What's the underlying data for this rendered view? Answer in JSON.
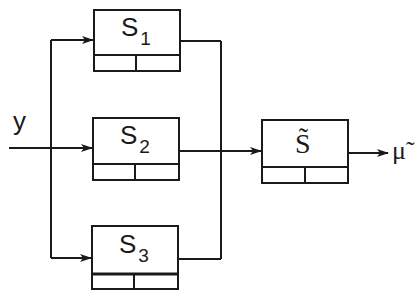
{
  "diagram": {
    "type": "block-diagram",
    "input_label": "y",
    "output_label": "μ̃",
    "blocks": [
      {
        "id": "S1",
        "name": "S",
        "subscript": "1"
      },
      {
        "id": "S2",
        "name": "S",
        "subscript": "2"
      },
      {
        "id": "S3",
        "name": "S",
        "subscript": "3"
      },
      {
        "id": "S_tilde",
        "name": "S̃",
        "subscript": ""
      }
    ],
    "edges": [
      {
        "from": "y",
        "to": "S1"
      },
      {
        "from": "y",
        "to": "S2"
      },
      {
        "from": "y",
        "to": "S3"
      },
      {
        "from": "S1",
        "to": "S_tilde"
      },
      {
        "from": "S2",
        "to": "S_tilde"
      },
      {
        "from": "S3",
        "to": "S_tilde"
      },
      {
        "from": "S_tilde",
        "to": "μ̃"
      }
    ],
    "colors": {
      "stroke": "#1a1a1a",
      "background": "#ffffff"
    }
  }
}
